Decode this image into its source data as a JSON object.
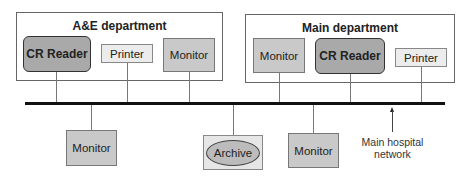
{
  "departments": [
    {
      "title": "A&E department",
      "devices": [
        "CR Reader",
        "Printer",
        "Monitor"
      ]
    },
    {
      "title": "Main department",
      "devices": [
        "Monitor",
        "CR Reader",
        "Printer"
      ]
    }
  ],
  "network_devices": [
    "Monitor",
    "Archive",
    "Monitor"
  ],
  "network": {
    "label_line1": "Main hospital",
    "label_line2": "network"
  }
}
